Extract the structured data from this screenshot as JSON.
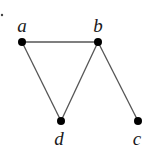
{
  "graph": {
    "marker_dot": {
      "x": 2,
      "y": 15
    },
    "nodes": [
      {
        "id": "a",
        "label": "a",
        "x": 22,
        "y": 42,
        "lx": 22,
        "ly": 32
      },
      {
        "id": "b",
        "label": "b",
        "x": 98,
        "y": 42,
        "lx": 98,
        "ly": 32
      },
      {
        "id": "d",
        "label": "d",
        "x": 61,
        "y": 121,
        "lx": 59,
        "ly": 145
      },
      {
        "id": "c",
        "label": "c",
        "x": 138,
        "y": 121,
        "lx": 137,
        "ly": 145
      }
    ],
    "edges": [
      {
        "from": "a",
        "to": "b"
      },
      {
        "from": "a",
        "to": "d"
      },
      {
        "from": "d",
        "to": "b"
      },
      {
        "from": "b",
        "to": "c"
      }
    ]
  }
}
